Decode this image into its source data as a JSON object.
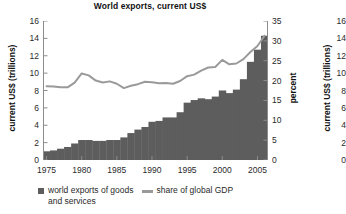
{
  "chart_data": {
    "type": "bar",
    "title": "World exports, current US$",
    "xlabel": "",
    "ylabel": "current US$ (trillions)",
    "ylabel_right": "percent",
    "ylim": [
      0,
      16
    ],
    "ylim_right": [
      0,
      35
    ],
    "grid": false,
    "legend_position": "bottom-left",
    "x": [
      1975,
      1976,
      1977,
      1978,
      1979,
      1980,
      1981,
      1982,
      1983,
      1984,
      1985,
      1986,
      1987,
      1988,
      1989,
      1990,
      1991,
      1992,
      1993,
      1994,
      1995,
      1996,
      1997,
      1998,
      1999,
      2000,
      2001,
      2002,
      2003,
      2004,
      2005,
      2006
    ],
    "categories": [
      "1975",
      "1976",
      "1977",
      "1978",
      "1979",
      "1980",
      "1981",
      "1982",
      "1983",
      "1984",
      "1985",
      "1986",
      "1987",
      "1988",
      "1989",
      "1990",
      "1991",
      "1992",
      "1993",
      "1994",
      "1995",
      "1996",
      "1997",
      "1998",
      "1999",
      "2000",
      "2001",
      "2002",
      "2003",
      "2004",
      "2005",
      "2006"
    ],
    "x_ticks": [
      1975,
      1980,
      1985,
      1990,
      1995,
      2000,
      2005
    ],
    "x_tick_labels": [
      "1975",
      "1980",
      "1985",
      "1990",
      "1995",
      "2000",
      "2005"
    ],
    "y_ticks_left": [
      0,
      2,
      4,
      6,
      8,
      10,
      12,
      14,
      16
    ],
    "y_tick_labels_left": [
      "0",
      "2",
      "4",
      "6",
      "8",
      "10",
      "12",
      "14",
      "16"
    ],
    "y_ticks_right": [
      0,
      5,
      10,
      15,
      20,
      25,
      30,
      35
    ],
    "y_tick_labels_right": [
      "0",
      "5",
      "10",
      "15",
      "20",
      "25",
      "30",
      "35"
    ],
    "series": [
      {
        "name": "world exports of goods and services",
        "type": "bar",
        "axis": "left",
        "unit": "trillions US$",
        "color": "#5d5d5d",
        "values": [
          1.0,
          1.1,
          1.3,
          1.5,
          1.9,
          2.3,
          2.3,
          2.2,
          2.2,
          2.3,
          2.3,
          2.6,
          3.1,
          3.5,
          3.8,
          4.4,
          4.5,
          4.9,
          4.9,
          5.5,
          6.6,
          6.9,
          7.1,
          7.0,
          7.3,
          8.0,
          7.7,
          8.1,
          9.3,
          11.3,
          12.7,
          14.3
        ]
      },
      {
        "name": "share of global GDP",
        "type": "line",
        "axis": "right",
        "unit": "percent",
        "color": "#9a9a9a",
        "values": [
          18.6,
          18.5,
          18.3,
          18.3,
          19.5,
          21.8,
          21.3,
          20.0,
          19.5,
          19.8,
          19.2,
          18.1,
          18.7,
          19.1,
          19.7,
          19.6,
          19.3,
          19.4,
          19.2,
          19.9,
          21.1,
          21.5,
          22.5,
          23.3,
          23.4,
          25.2,
          24.1,
          24.3,
          25.4,
          27.2,
          28.7,
          31.3
        ]
      }
    ],
    "legend": [
      {
        "label": "world exports of goods",
        "label_line2": "and services",
        "marker": "square",
        "color": "#5d5d5d"
      },
      {
        "label": "share of global GDP",
        "marker": "line",
        "color": "#9a9a9a"
      }
    ]
  },
  "chart2": {
    "ylabel": "current US$ (trillions)",
    "y_tick_labels": [
      "16",
      "14",
      "12",
      "10",
      "8",
      "6",
      "4",
      "2",
      "0"
    ]
  }
}
